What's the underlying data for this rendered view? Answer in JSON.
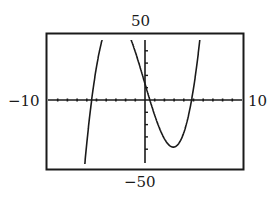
{
  "chart_data": {
    "type": "line",
    "title": "",
    "xlabel": "",
    "ylabel": "",
    "xlim": [
      -10,
      10
    ],
    "ylim": [
      -50,
      50
    ],
    "window_labels": {
      "xmin": "−10",
      "xmax": "10",
      "ymin": "−50",
      "ymax": "50"
    },
    "x_tick_step": 1,
    "y_tick_step": 10,
    "grid": false,
    "series": [
      {
        "name": "f(x)",
        "description": "cubic with roots near x = -5.5, 0.5, 4.8; local minimum near (2.8, -39)",
        "roots": [
          -5.5,
          0.5,
          4.8
        ],
        "leading_coefficient": 1,
        "x": [
          -6.0,
          -5.8,
          -5.6,
          -5.5,
          -5.4,
          -5.2,
          -5.0,
          -4.9,
          -1.2,
          -1.0,
          -0.5,
          0,
          0.5,
          1.0,
          1.5,
          2.0,
          2.5,
          2.8,
          3.0,
          3.5,
          4.0,
          4.5,
          4.8,
          5.0,
          5.3,
          5.6
        ],
        "y": [
          -50.4,
          -29.9,
          -9.6,
          0,
          9.8,
          28.9,
          47.0,
          55.8,
          56.4,
          49.2,
          32.2,
          13.2,
          0,
          -12.2,
          -22.4,
          -29.8,
          -35.1,
          -38.4,
          -36.1,
          -33.0,
          -26.8,
          -15.6,
          0,
          10.6,
          29.0,
          48.0
        ]
      }
    ]
  }
}
